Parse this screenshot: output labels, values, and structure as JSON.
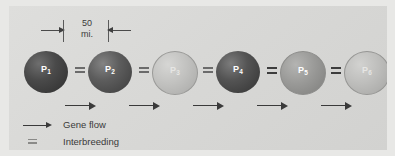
{
  "figure": {
    "background_color": "#d8d8d6",
    "outer_color": "#e8e8e6"
  },
  "scale_bar": {
    "value": "50",
    "unit": "mi.",
    "left_arrow_icon": "arrow-right-icon",
    "right_arrow_icon": "arrow-left-icon"
  },
  "populations": [
    {
      "id": "p1",
      "label": "P",
      "subscript": "1",
      "shade": "dark",
      "color": "#2e2e2e"
    },
    {
      "id": "p2",
      "label": "P",
      "subscript": "2",
      "shade": "dark-medium",
      "color": "#3c3c3c"
    },
    {
      "id": "p3",
      "label": "P",
      "subscript": "3",
      "shade": "light",
      "color": "#c2c2c0"
    },
    {
      "id": "p4",
      "label": "P",
      "subscript": "4",
      "shade": "dark",
      "color": "#333333"
    },
    {
      "id": "p5",
      "label": "P",
      "subscript": "5",
      "shade": "medium",
      "color": "#9a9a98"
    },
    {
      "id": "p6",
      "label": "P",
      "subscript": "6",
      "shade": "lightest",
      "color": "#bebebc"
    }
  ],
  "interbreeding_links": [
    {
      "between": "P1-P2",
      "symbol": "equals"
    },
    {
      "between": "P2-P3",
      "symbol": "equals"
    },
    {
      "between": "P3-P4",
      "symbol": "equals"
    },
    {
      "between": "P4-P5",
      "symbol": "equals"
    },
    {
      "between": "P5-P6",
      "symbol": "equals"
    }
  ],
  "gene_flow_arrows": [
    {
      "between": "P1-P2",
      "direction": "right"
    },
    {
      "between": "P2-P3",
      "direction": "right"
    },
    {
      "between": "P3-P4",
      "direction": "right"
    },
    {
      "between": "P4-P5",
      "direction": "right"
    },
    {
      "between": "P5-P6",
      "direction": "right"
    }
  ],
  "legend": {
    "items": [
      {
        "key_icon": "arrow-right-icon",
        "label": "Gene flow"
      },
      {
        "key_icon": "equals-icon",
        "label": "Interbreeding"
      }
    ]
  }
}
